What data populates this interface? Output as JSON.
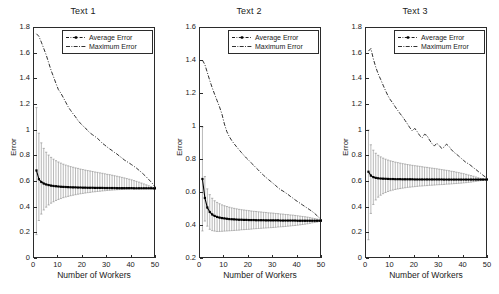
{
  "figure": {
    "ylabel": "Error",
    "xlabel": "Number of Workers",
    "legend": {
      "average": "Average Error",
      "maximum": "Maximum Error"
    },
    "colors": {
      "axis": "#2b2b2b",
      "average": "#000000",
      "maximum": "#1a1a1a",
      "errorbar": "#8a8a8a",
      "background": "#ffffff"
    }
  },
  "chart_data": [
    {
      "type": "line",
      "title": "Text 1",
      "xlabel": "Number of Workers",
      "ylabel": "Error",
      "xlim": [
        0,
        50
      ],
      "ylim": [
        0,
        1.8
      ],
      "xticks": [
        0,
        10,
        20,
        30,
        40,
        50
      ],
      "yticks": [
        0,
        0.2,
        0.4,
        0.6,
        0.8,
        1,
        1.2,
        1.4,
        1.6,
        1.8
      ],
      "grid": false,
      "legend_position": "top-right",
      "x": [
        1,
        2,
        3,
        4,
        5,
        6,
        7,
        8,
        9,
        10,
        11,
        12,
        13,
        14,
        15,
        16,
        17,
        18,
        19,
        20,
        21,
        22,
        23,
        24,
        25,
        26,
        27,
        28,
        29,
        30,
        31,
        32,
        33,
        34,
        35,
        36,
        37,
        38,
        39,
        40,
        41,
        42,
        43,
        44,
        45,
        46,
        47,
        48,
        49,
        50
      ],
      "series": [
        {
          "name": "Average Error",
          "values": [
            0.69,
            0.622,
            0.6,
            0.588,
            0.581,
            0.576,
            0.572,
            0.569,
            0.567,
            0.565,
            0.563,
            0.562,
            0.561,
            0.56,
            0.559,
            0.558,
            0.558,
            0.557,
            0.557,
            0.556,
            0.556,
            0.555,
            0.555,
            0.555,
            0.554,
            0.554,
            0.554,
            0.554,
            0.553,
            0.553,
            0.553,
            0.553,
            0.553,
            0.552,
            0.552,
            0.552,
            0.552,
            0.552,
            0.552,
            0.552,
            0.551,
            0.551,
            0.551,
            0.551,
            0.551,
            0.551,
            0.551,
            0.551,
            0.55,
            0.55
          ],
          "err_upper": [
            1.18,
            0.98,
            0.905,
            0.862,
            0.832,
            0.81,
            0.792,
            0.778,
            0.766,
            0.756,
            0.747,
            0.739,
            0.732,
            0.726,
            0.72,
            0.715,
            0.71,
            0.706,
            0.701,
            0.697,
            0.693,
            0.689,
            0.686,
            0.682,
            0.678,
            0.675,
            0.671,
            0.668,
            0.664,
            0.66,
            0.657,
            0.653,
            0.649,
            0.645,
            0.641,
            0.636,
            0.632,
            0.627,
            0.622,
            0.617,
            0.611,
            0.605,
            0.599,
            0.592,
            0.585,
            0.578,
            0.571,
            0.564,
            0.557,
            0.551
          ],
          "err_lower": [
            0.19,
            0.3,
            0.35,
            0.382,
            0.404,
            0.421,
            0.435,
            0.446,
            0.456,
            0.464,
            0.471,
            0.478,
            0.483,
            0.488,
            0.493,
            0.497,
            0.501,
            0.505,
            0.508,
            0.511,
            0.514,
            0.517,
            0.519,
            0.522,
            0.524,
            0.526,
            0.528,
            0.53,
            0.532,
            0.534,
            0.535,
            0.537,
            0.538,
            0.54,
            0.541,
            0.542,
            0.543,
            0.544,
            0.545,
            0.546,
            0.546,
            0.547,
            0.548,
            0.548,
            0.549,
            0.549,
            0.549,
            0.55,
            0.55,
            0.55
          ]
        },
        {
          "name": "Maximum Error",
          "values": [
            1.755,
            1.735,
            1.69,
            1.64,
            1.59,
            1.53,
            1.47,
            1.42,
            1.368,
            1.32,
            1.292,
            1.258,
            1.222,
            1.186,
            1.158,
            1.132,
            1.108,
            1.08,
            1.058,
            1.038,
            1.022,
            1.0,
            0.982,
            0.968,
            0.955,
            0.94,
            0.922,
            0.902,
            0.888,
            0.872,
            0.858,
            0.845,
            0.83,
            0.818,
            0.802,
            0.788,
            0.772,
            0.76,
            0.748,
            0.735,
            0.722,
            0.708,
            0.692,
            0.676,
            0.658,
            0.64,
            0.62,
            0.6,
            0.578,
            0.553
          ]
        }
      ]
    },
    {
      "type": "line",
      "title": "Text 2",
      "xlabel": "Number of Workers",
      "ylabel": "Error",
      "xlim": [
        0,
        50
      ],
      "ylim": [
        0.2,
        1.6
      ],
      "xticks": [
        0,
        10,
        20,
        30,
        40,
        50
      ],
      "yticks": [
        0.2,
        0.4,
        0.6,
        0.8,
        1,
        1.2,
        1.4,
        1.6
      ],
      "grid": false,
      "legend_position": "top-right",
      "x": [
        1,
        2,
        3,
        4,
        5,
        6,
        7,
        8,
        9,
        10,
        11,
        12,
        13,
        14,
        15,
        16,
        17,
        18,
        19,
        20,
        21,
        22,
        23,
        24,
        25,
        26,
        27,
        28,
        29,
        30,
        31,
        32,
        33,
        34,
        35,
        36,
        37,
        38,
        39,
        40,
        41,
        42,
        43,
        44,
        45,
        46,
        47,
        48,
        49,
        50
      ],
      "series": [
        {
          "name": "Average Error",
          "values": [
            0.685,
            0.57,
            0.512,
            0.485,
            0.47,
            0.461,
            0.455,
            0.451,
            0.448,
            0.446,
            0.444,
            0.442,
            0.441,
            0.44,
            0.439,
            0.438,
            0.438,
            0.437,
            0.437,
            0.436,
            0.436,
            0.436,
            0.435,
            0.435,
            0.435,
            0.435,
            0.434,
            0.434,
            0.434,
            0.434,
            0.434,
            0.434,
            0.433,
            0.433,
            0.433,
            0.433,
            0.433,
            0.433,
            0.433,
            0.432,
            0.432,
            0.432,
            0.432,
            0.432,
            0.432,
            0.432,
            0.432,
            0.432,
            0.432,
            0.432
          ],
          "err_upper": [
            1.0,
            0.7,
            0.625,
            0.59,
            0.568,
            0.553,
            0.543,
            0.535,
            0.528,
            0.523,
            0.518,
            0.514,
            0.51,
            0.507,
            0.504,
            0.501,
            0.499,
            0.497,
            0.495,
            0.493,
            0.491,
            0.489,
            0.488,
            0.486,
            0.485,
            0.483,
            0.482,
            0.48,
            0.479,
            0.478,
            0.476,
            0.475,
            0.473,
            0.472,
            0.47,
            0.469,
            0.467,
            0.466,
            0.464,
            0.462,
            0.46,
            0.458,
            0.456,
            0.454,
            0.451,
            0.448,
            0.445,
            0.442,
            0.438,
            0.434
          ],
          "err_lower": [
            0.37,
            0.43,
            0.399,
            0.38,
            0.372,
            0.369,
            0.367,
            0.367,
            0.368,
            0.369,
            0.37,
            0.371,
            0.372,
            0.373,
            0.374,
            0.375,
            0.377,
            0.378,
            0.379,
            0.38,
            0.381,
            0.383,
            0.384,
            0.385,
            0.386,
            0.387,
            0.388,
            0.389,
            0.39,
            0.391,
            0.392,
            0.394,
            0.395,
            0.396,
            0.397,
            0.399,
            0.4,
            0.402,
            0.403,
            0.405,
            0.407,
            0.409,
            0.411,
            0.413,
            0.416,
            0.419,
            0.421,
            0.424,
            0.428,
            0.431
          ]
        },
        {
          "name": "Maximum Error",
          "values": [
            1.405,
            1.378,
            1.33,
            1.282,
            1.238,
            1.198,
            1.16,
            1.122,
            1.078,
            1.018,
            0.972,
            0.942,
            0.918,
            0.898,
            0.88,
            0.862,
            0.845,
            0.828,
            0.812,
            0.798,
            0.782,
            0.768,
            0.752,
            0.738,
            0.722,
            0.708,
            0.695,
            0.682,
            0.67,
            0.658,
            0.645,
            0.632,
            0.62,
            0.612,
            0.602,
            0.592,
            0.58,
            0.57,
            0.558,
            0.548,
            0.538,
            0.528,
            0.518,
            0.508,
            0.498,
            0.488,
            0.476,
            0.462,
            0.448,
            0.435
          ]
        }
      ]
    },
    {
      "type": "line",
      "title": "Text 3",
      "xlabel": "Number of Workers",
      "ylabel": "Error",
      "xlim": [
        0,
        50
      ],
      "ylim": [
        0,
        1.8
      ],
      "xticks": [
        0,
        10,
        20,
        30,
        40,
        50
      ],
      "yticks": [
        0,
        0.2,
        0.4,
        0.6,
        0.8,
        1,
        1.2,
        1.4,
        1.6,
        1.8
      ],
      "grid": false,
      "legend_position": "top-right",
      "x": [
        1,
        2,
        3,
        4,
        5,
        6,
        7,
        8,
        9,
        10,
        11,
        12,
        13,
        14,
        15,
        16,
        17,
        18,
        19,
        20,
        21,
        22,
        23,
        24,
        25,
        26,
        27,
        28,
        29,
        30,
        31,
        32,
        33,
        34,
        35,
        36,
        37,
        38,
        39,
        40,
        41,
        42,
        43,
        44,
        45,
        46,
        47,
        48,
        49,
        50
      ],
      "series": [
        {
          "name": "Average Error",
          "values": [
            0.68,
            0.65,
            0.638,
            0.632,
            0.629,
            0.627,
            0.626,
            0.625,
            0.624,
            0.623,
            0.623,
            0.622,
            0.622,
            0.622,
            0.621,
            0.621,
            0.621,
            0.621,
            0.621,
            0.62,
            0.62,
            0.62,
            0.62,
            0.62,
            0.62,
            0.62,
            0.62,
            0.62,
            0.62,
            0.62,
            0.62,
            0.619,
            0.619,
            0.619,
            0.619,
            0.619,
            0.619,
            0.619,
            0.619,
            0.619,
            0.619,
            0.619,
            0.619,
            0.619,
            0.619,
            0.619,
            0.619,
            0.619,
            0.619,
            0.619
          ],
          "err_upper": [
            1.005,
            0.89,
            0.848,
            0.824,
            0.808,
            0.796,
            0.786,
            0.778,
            0.771,
            0.765,
            0.76,
            0.755,
            0.751,
            0.747,
            0.743,
            0.74,
            0.736,
            0.733,
            0.73,
            0.727,
            0.725,
            0.722,
            0.719,
            0.716,
            0.714,
            0.711,
            0.708,
            0.706,
            0.703,
            0.7,
            0.697,
            0.694,
            0.691,
            0.688,
            0.684,
            0.681,
            0.677,
            0.673,
            0.669,
            0.665,
            0.66,
            0.655,
            0.65,
            0.645,
            0.639,
            0.633,
            0.628,
            0.624,
            0.621,
            0.62
          ],
          "err_lower": [
            0.15,
            0.355,
            0.425,
            0.46,
            0.482,
            0.497,
            0.509,
            0.518,
            0.526,
            0.532,
            0.537,
            0.542,
            0.546,
            0.549,
            0.552,
            0.555,
            0.558,
            0.56,
            0.562,
            0.564,
            0.566,
            0.568,
            0.569,
            0.571,
            0.572,
            0.574,
            0.575,
            0.576,
            0.578,
            0.579,
            0.58,
            0.581,
            0.583,
            0.584,
            0.585,
            0.587,
            0.588,
            0.59,
            0.591,
            0.593,
            0.595,
            0.597,
            0.599,
            0.602,
            0.605,
            0.608,
            0.611,
            0.614,
            0.617,
            0.619
          ]
        },
        {
          "name": "Maximum Error",
          "values": [
            1.62,
            1.64,
            1.56,
            1.495,
            1.442,
            1.4,
            1.355,
            1.312,
            1.272,
            1.24,
            1.215,
            1.185,
            1.158,
            1.132,
            1.108,
            1.08,
            1.052,
            1.022,
            0.998,
            1.018,
            0.992,
            0.962,
            0.945,
            0.972,
            0.962,
            0.928,
            0.9,
            0.88,
            0.902,
            0.885,
            0.862,
            0.872,
            0.895,
            0.878,
            0.852,
            0.832,
            0.818,
            0.802,
            0.785,
            0.768,
            0.752,
            0.742,
            0.728,
            0.712,
            0.698,
            0.682,
            0.668,
            0.652,
            0.638,
            0.622
          ]
        }
      ]
    }
  ]
}
